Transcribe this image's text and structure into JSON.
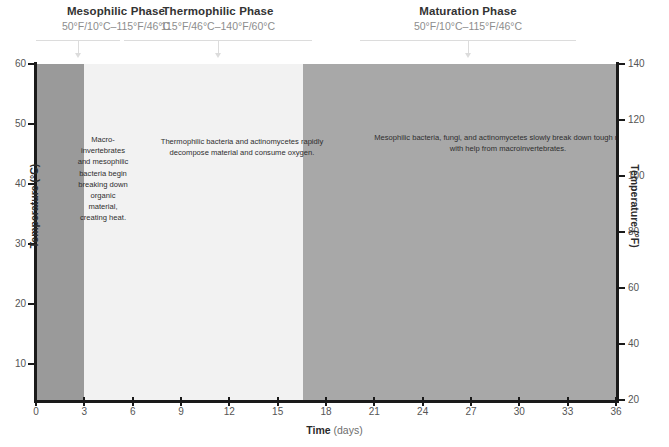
{
  "phases": [
    {
      "id": "mesophilic",
      "title": "Mesophilic Phase",
      "range": "50°F/10°C–115°F/46°C",
      "annotation": "Macro-invertebrates and mesophilic bacteria begin breaking down organic material, creating heat.",
      "band_color": "#9a9a9a",
      "start_day": 0,
      "end_day": 3
    },
    {
      "id": "thermophilic",
      "title": "Thermophilic Phase",
      "range": "115°F/46°C–140°F/60°C",
      "annotation": "Thermophilic bacteria and actinomycetes rapidly decompose material and consume oxygen.",
      "band_color": "#f2f2f2",
      "start_day": 3,
      "end_day": 16.6
    },
    {
      "id": "maturation",
      "title": "Maturation Phase",
      "range": "50°F/10°C–115°F/46°C",
      "annotation": "Mesophilic bacteria, fungi, and actinomycetes slowly break down tough material with help from macroinvertebrates.",
      "band_color": "#a8a8a8",
      "start_day": 16.6,
      "end_day": 36
    }
  ],
  "chart_data": {
    "type": "line",
    "title": "",
    "xlabel": "Time",
    "xlabel_unit": "(days)",
    "ylabel": "Temperature (°C)",
    "ylabel_right": "Temperature (°F)",
    "xlim": [
      0,
      36
    ],
    "ylim": [
      4,
      60
    ],
    "ylim_right": [
      20,
      140
    ],
    "grid": false,
    "legend": "none",
    "xticks": [
      0,
      3,
      6,
      9,
      12,
      15,
      18,
      21,
      24,
      27,
      30,
      33,
      36
    ],
    "yticks": [
      10,
      20,
      30,
      40,
      50,
      60
    ],
    "yticks_right": [
      20,
      40,
      60,
      80,
      100,
      120,
      140
    ],
    "line_color": "#1a1a1a",
    "series": [
      {
        "name": "Compost pile temperature",
        "x": [
          0,
          0.5,
          1.0,
          1.5,
          2.0,
          2.5,
          3.0,
          3.4,
          3.8,
          4.2,
          4.6,
          5.0,
          5.4,
          5.8,
          6.2,
          6.6,
          7.0,
          7.4,
          7.8,
          8.2,
          8.6,
          9.0,
          9.4,
          9.8,
          10.2,
          10.6,
          11.0,
          11.4,
          11.8,
          12.2,
          12.6,
          13.0,
          13.4,
          13.8,
          14.2,
          14.6,
          15.0,
          15.4,
          15.8,
          16.2,
          16.6,
          17.0,
          17.4,
          17.8,
          18.2,
          18.6,
          19.0,
          19.4,
          19.8,
          20.2,
          20.6,
          21.0,
          21.6,
          22.2,
          22.8,
          23.4,
          24.0,
          24.6,
          25.2,
          25.8,
          26.4,
          27.0,
          27.6,
          28.2,
          28.8,
          29.4,
          30.0,
          30.6,
          31.2,
          31.8,
          32.4,
          33.0,
          33.6,
          34.2,
          34.8,
          35.4,
          36.0
        ],
        "y": [
          11.5,
          15.5,
          20.5,
          26.5,
          32.0,
          36.5,
          40.5,
          41.0,
          44.0,
          45.0,
          47.0,
          47.3,
          47.3,
          49.5,
          49.5,
          49.8,
          51.0,
          50.5,
          49.5,
          49.5,
          49.5,
          47.8,
          47.8,
          47.0,
          46.5,
          47.0,
          48.0,
          49.0,
          48.5,
          48.0,
          48.0,
          47.3,
          47.0,
          46.0,
          45.5,
          44.5,
          44.0,
          43.0,
          41.5,
          41.5,
          38.0,
          35.5,
          34.5,
          34.5,
          31.0,
          25.5,
          20.0,
          22.5,
          21.5,
          21.0,
          21.0,
          20.5,
          19.5,
          18.5,
          18.0,
          18.0,
          16.5,
          15.0,
          14.0,
          13.5,
          11.8,
          11.8,
          13.0,
          11.5,
          11.5,
          13.0,
          11.5,
          11.0,
          11.5,
          11.8,
          12.0,
          12.0,
          12.0,
          11.8,
          11.8,
          11.8,
          11.8
        ]
      }
    ]
  }
}
